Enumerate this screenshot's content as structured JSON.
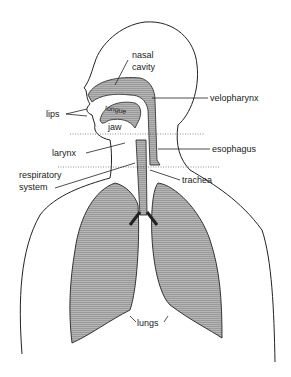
{
  "diagram": {
    "title": "",
    "labels": {
      "nasal_cavity_1": "nasal",
      "nasal_cavity_2": "cavity",
      "velopharynx": "velopharynx",
      "lips": "lips",
      "tongue": "tongue",
      "jaw": "jaw",
      "larynx": "larynx",
      "esophagus": "esophagus",
      "respiratory_1": "respiratory",
      "respiratory_2": "system",
      "trachea": "trachea",
      "lungs": "lungs"
    },
    "colors": {
      "line": "#222222",
      "fill": "#a9a9a9",
      "background": "#ffffff"
    }
  }
}
